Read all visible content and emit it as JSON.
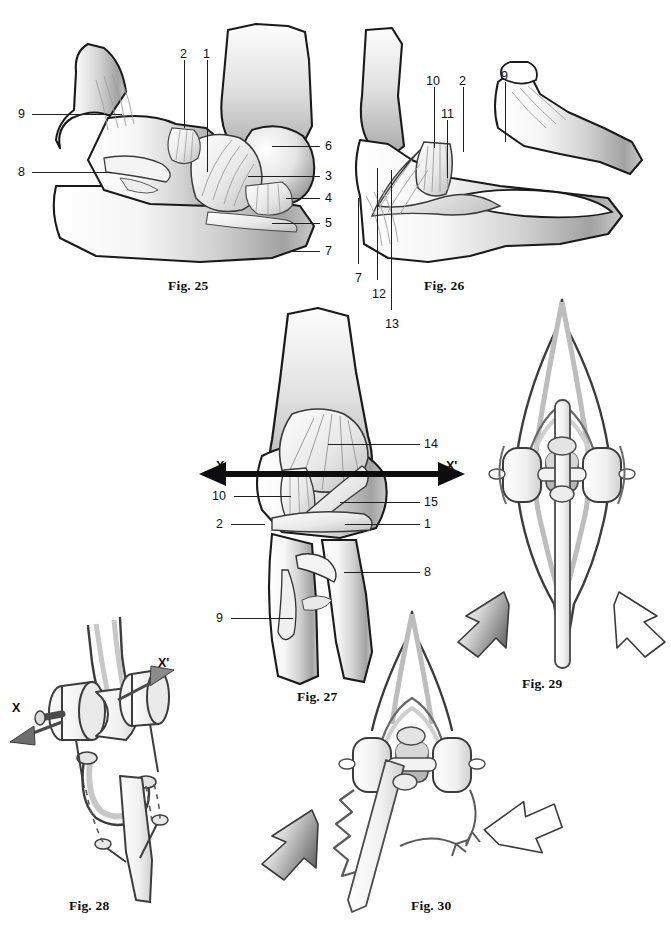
{
  "plate": {
    "width": 671,
    "height": 935,
    "background": "#ffffff",
    "ink": "#111111",
    "shade_light": "#f2f2f2",
    "shade_mid": "#cfcfcf",
    "shade_dark": "#8d8d8d",
    "outline": "#1a1a1a"
  },
  "figures": [
    {
      "id": "fig25",
      "caption": "Fig. 25",
      "caption_pos": {
        "x": 168,
        "y": 278
      },
      "labels": [
        {
          "text": "9",
          "x": 18,
          "y": 108,
          "leader": [
            32,
            114,
            122,
            114
          ]
        },
        {
          "text": "8",
          "x": 18,
          "y": 166,
          "leader": [
            32,
            172,
            112,
            172
          ]
        },
        {
          "text": "2",
          "x": 180,
          "y": 48,
          "leader": [
            184,
            60,
            184,
            128
          ]
        },
        {
          "text": "1",
          "x": 203,
          "y": 48,
          "leader": [
            207,
            60,
            207,
            172
          ]
        },
        {
          "text": "6",
          "x": 325,
          "y": 140,
          "leader": [
            272,
            146,
            320,
            146
          ]
        },
        {
          "text": "3",
          "x": 325,
          "y": 170,
          "leader": [
            248,
            176,
            320,
            176
          ]
        },
        {
          "text": "4",
          "x": 325,
          "y": 192,
          "leader": [
            286,
            198,
            320,
            198
          ]
        },
        {
          "text": "5",
          "x": 325,
          "y": 217,
          "leader": [
            272,
            223,
            320,
            223
          ]
        },
        {
          "text": "7",
          "x": 325,
          "y": 245,
          "leader": [
            289,
            251,
            320,
            251
          ]
        }
      ]
    },
    {
      "id": "fig26",
      "caption": "Fig. 26",
      "caption_pos": {
        "x": 424,
        "y": 278
      },
      "labels": [
        {
          "text": "10",
          "x": 426,
          "y": 75,
          "leader": [
            434,
            87,
            434,
            148
          ]
        },
        {
          "text": "2",
          "x": 459,
          "y": 75,
          "leader": [
            463,
            87,
            463,
            152
          ]
        },
        {
          "text": "9",
          "x": 501,
          "y": 70,
          "leader": [
            505,
            82,
            505,
            142
          ]
        },
        {
          "text": "11",
          "x": 441,
          "y": 108,
          "leader": [
            447,
            120,
            447,
            178
          ]
        },
        {
          "text": "7",
          "x": 355,
          "y": 272,
          "leader": [
            358,
            198,
            358,
            264
          ]
        },
        {
          "text": "12",
          "x": 372,
          "y": 288,
          "leader": [
            377,
            168,
            377,
            280
          ]
        },
        {
          "text": "13",
          "x": 385,
          "y": 318,
          "leader": [
            391,
            170,
            391,
            310
          ]
        }
      ]
    },
    {
      "id": "fig27",
      "caption": "Fig. 27",
      "caption_pos": {
        "x": 297,
        "y": 689
      },
      "labels": [
        {
          "text": "14",
          "x": 424,
          "y": 438,
          "leader": [
            328,
            444,
            420,
            444
          ]
        },
        {
          "text": "10",
          "x": 212,
          "y": 490,
          "leader": [
            234,
            496,
            291,
            496
          ]
        },
        {
          "text": "15",
          "x": 424,
          "y": 496,
          "leader": [
            340,
            502,
            420,
            502
          ]
        },
        {
          "text": "2",
          "x": 216,
          "y": 518,
          "leader": [
            231,
            524,
            265,
            524
          ]
        },
        {
          "text": "1",
          "x": 424,
          "y": 518,
          "leader": [
            345,
            524,
            420,
            524
          ]
        },
        {
          "text": "8",
          "x": 424,
          "y": 566,
          "leader": [
            344,
            572,
            420,
            572
          ]
        },
        {
          "text": "9",
          "x": 216,
          "y": 612,
          "leader": [
            231,
            618,
            293,
            618
          ]
        }
      ],
      "axes": [
        {
          "text": "X",
          "x": 216,
          "y": 460,
          "arrow": {
            "x1": 271,
            "y1": 474,
            "x2": 205,
            "y2": 474
          }
        },
        {
          "text": "X'",
          "x": 446,
          "y": 460,
          "arrow": {
            "x1": 395,
            "y1": 474,
            "x2": 459,
            "y2": 474
          }
        }
      ]
    },
    {
      "id": "fig28",
      "caption": "Fig. 28",
      "caption_pos": {
        "x": 69,
        "y": 898
      },
      "axes": [
        {
          "text": "X",
          "x": 12,
          "y": 702,
          "arrow": {
            "x1": 58,
            "y1": 723,
            "x2": 10,
            "y2": 740
          }
        },
        {
          "text": "X'",
          "x": 158,
          "y": 657,
          "arrow": {
            "x1": 118,
            "y1": 698,
            "x2": 168,
            "y2": 672
          }
        }
      ]
    },
    {
      "id": "fig29",
      "caption": "Fig. 29",
      "caption_pos": {
        "x": 522,
        "y": 676
      },
      "motion_arrows": [
        {
          "name": "rotation-arrow-left",
          "fill": "gradient-dark"
        },
        {
          "name": "rotation-arrow-right",
          "fill": "white"
        }
      ]
    },
    {
      "id": "fig30",
      "caption": "Fig. 30",
      "caption_pos": {
        "x": 411,
        "y": 898
      },
      "motion_arrows": [
        {
          "name": "displacement-arrow-left",
          "fill": "gradient-dark"
        },
        {
          "name": "displacement-arrow-up",
          "fill": "white"
        }
      ]
    }
  ],
  "footer_text": "",
  "icons": {
    "axis_arrow": "double-headed-axis-arrow",
    "motion_arrow": "curved-block-arrow",
    "leader": "leader-line"
  }
}
